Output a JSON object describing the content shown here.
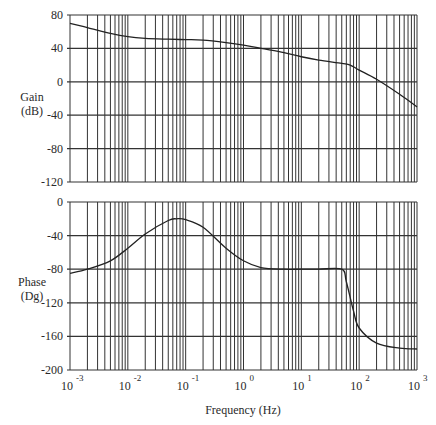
{
  "chart_data": [
    {
      "type": "line",
      "title": "",
      "xlabel": "Frequency (Hz)",
      "ylabel": "Gain (dB)",
      "ylabel_lines": [
        "Gain",
        "(dB)"
      ],
      "xscale": "log",
      "xlim": [
        0.001,
        1000
      ],
      "ylim": [
        -120,
        80
      ],
      "yticks": [
        80,
        40,
        0,
        -40,
        -80,
        -120
      ],
      "grid": true,
      "series": [
        {
          "name": "Gain",
          "x": [
            0.001,
            0.002,
            0.005,
            0.01,
            0.02,
            0.05,
            0.1,
            0.2,
            0.5,
            1,
            2,
            5,
            10,
            20,
            50,
            70,
            100,
            200,
            500,
            1000
          ],
          "y": [
            70,
            65,
            58,
            54,
            52,
            51,
            50.5,
            50,
            47,
            44,
            40,
            35,
            30,
            26,
            22,
            20,
            14,
            3,
            -15,
            -30
          ]
        }
      ]
    },
    {
      "type": "line",
      "title": "",
      "xlabel": "Frequency (Hz)",
      "ylabel": "Phase (Dg)",
      "ylabel_lines": [
        "Phase",
        "(Dg)"
      ],
      "xscale": "log",
      "xlim": [
        0.001,
        1000
      ],
      "ylim": [
        -200,
        0
      ],
      "yticks": [
        0,
        -40,
        -80,
        -120,
        -160,
        -200
      ],
      "xticks": [
        "10^-3",
        "10^-2",
        "10^-1",
        "10^0",
        "10^1",
        "10^2",
        "10^3"
      ],
      "grid": true,
      "series": [
        {
          "name": "Phase",
          "x": [
            0.001,
            0.002,
            0.005,
            0.01,
            0.02,
            0.05,
            0.07,
            0.1,
            0.2,
            0.5,
            1,
            2,
            5,
            10,
            20,
            50,
            60,
            80,
            100,
            200,
            500,
            1000
          ],
          "y": [
            -85,
            -80,
            -70,
            -55,
            -38,
            -22,
            -20,
            -21,
            -30,
            -55,
            -70,
            -78,
            -80,
            -80,
            -80,
            -80,
            -95,
            -130,
            -150,
            -168,
            -174,
            -175
          ]
        }
      ]
    }
  ],
  "labels": {
    "gain_line1": "Gain",
    "gain_line2": "(dB)",
    "phase_line1": "Phase",
    "phase_line2": "(Dg)",
    "xlabel": "Frequency (Hz)"
  }
}
